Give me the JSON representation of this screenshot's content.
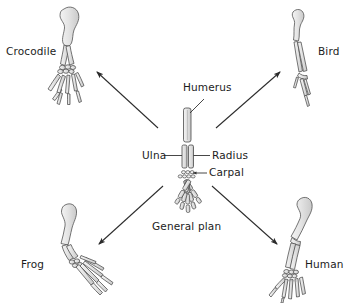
{
  "figure": {
    "title_visible": false,
    "background_color": "#ffffff",
    "ink_color": "#3a3a3a",
    "bone_fill": "#e8e8e8",
    "bone_fill_dark": "#cfcfcf",
    "text_color": "#1c1c1c",
    "arrow_color": "#2b2b2b"
  },
  "labels": {
    "crocodile": "Crocodile",
    "bird": "Bird",
    "frog": "Frog",
    "human": "Human",
    "general_plan": "General plan",
    "humerus": "Humerus",
    "ulna": "Ulna",
    "radius": "Radius",
    "carpal": "Carpal"
  },
  "diagram_data": {
    "type": "diagram",
    "subject": "Homologous pentadactyl limb structures in vertebrates",
    "center_item": "General plan",
    "center_bone_parts": [
      "Humerus",
      "Ulna",
      "Radius",
      "Carpal"
    ],
    "radiating_organisms": [
      {
        "name": "Crocodile",
        "direction": "top-left"
      },
      {
        "name": "Bird",
        "direction": "top-right"
      },
      {
        "name": "Frog",
        "direction": "bottom-left"
      },
      {
        "name": "Human",
        "direction": "bottom-right"
      }
    ],
    "arrow_count": 4,
    "leader_line_labels": [
      "Humerus",
      "Ulna",
      "Radius",
      "Carpal"
    ]
  }
}
